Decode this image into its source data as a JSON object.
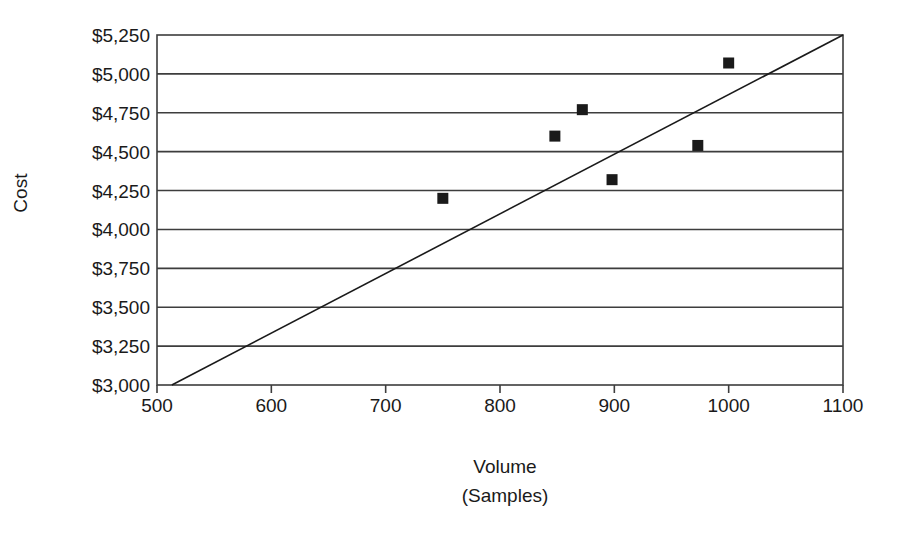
{
  "chart_data": {
    "type": "scatter",
    "title": "",
    "xlabel": "Volume\n(Samples)",
    "xlabel_line1": "Volume",
    "xlabel_line2": "(Samples)",
    "ylabel": "Cost",
    "xlim": [
      500,
      1100
    ],
    "ylim": [
      3000,
      5250
    ],
    "grid": "horizontal",
    "legend": "none",
    "x_ticks": [
      500,
      600,
      700,
      800,
      900,
      1000,
      1100
    ],
    "x_tick_labels": [
      "500",
      "600",
      "700",
      "800",
      "900",
      "1000",
      "1100"
    ],
    "y_ticks": [
      3000,
      3250,
      3500,
      3750,
      4000,
      4250,
      4500,
      4750,
      5000,
      5250
    ],
    "y_tick_labels": [
      "$3,000",
      "$3,250",
      "$3,500",
      "$3,750",
      "$4,000",
      "$4,250",
      "$4,500",
      "$4,750",
      "$5,000",
      "$5,250"
    ],
    "series": [
      {
        "name": "Cost observations",
        "marker": "square",
        "color": "#1a1a1a",
        "points": [
          {
            "x": 750,
            "y": 4200
          },
          {
            "x": 848,
            "y": 4600
          },
          {
            "x": 872,
            "y": 4770
          },
          {
            "x": 898,
            "y": 4320
          },
          {
            "x": 973,
            "y": 4540
          },
          {
            "x": 1000,
            "y": 5070
          }
        ]
      },
      {
        "name": "Trend line",
        "marker": "none",
        "type": "line",
        "color": "#1a1a1a",
        "points": [
          {
            "x": 513,
            "y": 3000
          },
          {
            "x": 1100,
            "y": 5250
          }
        ]
      }
    ]
  },
  "axis_style": {
    "frame_color": "#3d3d3d",
    "gridline_color": "#3d3d3d",
    "background": "#ffffff"
  }
}
